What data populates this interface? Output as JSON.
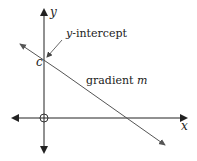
{
  "diagram": {
    "type": "linear-graph",
    "axes": {
      "x_label": "x",
      "y_label": "y",
      "origin_marker": "circle"
    },
    "labels": {
      "intercept_letter": "c",
      "intercept_text_prefix": "y",
      "intercept_text_suffix": "-intercept",
      "gradient_text": "gradient ",
      "gradient_symbol": "m"
    },
    "colors": {
      "axis": "#222222",
      "line": "#555555",
      "text": "#222222"
    }
  }
}
